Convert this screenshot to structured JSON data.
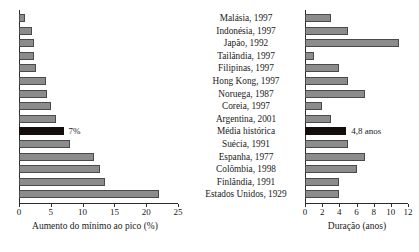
{
  "chart_data": [
    {
      "type": "bar",
      "orientation": "horizontal",
      "title": "",
      "xlabel": "Aumento do mínimo ao pico (%)",
      "ylabel": "",
      "xlim": [
        0,
        25
      ],
      "xticks": [
        0,
        5,
        10,
        15,
        20,
        25
      ],
      "grid": false,
      "legend": null,
      "categories": [
        "Malásia, 1997",
        "Indonésia, 1997",
        "Japão, 1992",
        "Tailândia, 1997",
        "Filipinas, 1997",
        "Hong Kong, 1997",
        "Noruega, 1987",
        "Coreia, 1997",
        "Argentina, 2001",
        "Média histórica",
        "Suécia, 1991",
        "Espanha, 1977",
        "Colômbia, 1998",
        "Finlândia, 1991",
        "Estados Unidos, 1929"
      ],
      "values": [
        1.0,
        2.0,
        2.4,
        2.4,
        2.7,
        4.3,
        4.4,
        5.0,
        5.8,
        7.0,
        8.0,
        11.8,
        12.8,
        13.5,
        22.0
      ],
      "annotations": [
        {
          "category": "Média histórica",
          "text": "7%"
        }
      ],
      "highlight_category": "Média histórica"
    },
    {
      "type": "bar",
      "orientation": "horizontal",
      "title": "",
      "xlabel": "Duração (anos)",
      "ylabel": "",
      "xlim": [
        0,
        12
      ],
      "xticks": [
        0,
        2,
        4,
        6,
        8,
        10,
        12
      ],
      "grid": false,
      "legend": null,
      "categories": [
        "Malásia, 1997",
        "Indonésia, 1997",
        "Japão, 1992",
        "Tailândia, 1997",
        "Filipinas, 1997",
        "Hong Kong, 1997",
        "Noruega, 1987",
        "Coreia, 1997",
        "Argentina, 2001",
        "Média histórica",
        "Suécia, 1991",
        "Espanha, 1977",
        "Colômbia, 1998",
        "Finlândia, 1991",
        "Estados Unidos, 1929"
      ],
      "values": [
        3.0,
        5.0,
        11.0,
        1.0,
        4.0,
        5.0,
        7.0,
        2.0,
        3.0,
        4.8,
        5.0,
        7.0,
        6.0,
        4.0,
        4.0
      ],
      "annotations": [
        {
          "category": "Média histórica",
          "text": "4,8 anos"
        }
      ],
      "highlight_category": "Média histórica"
    }
  ],
  "colors": {
    "bar_fill": "#8c8c8c",
    "bar_edge": "#4a4a4a",
    "highlight_fill": "#140d0b",
    "axis": "#2b2b2b",
    "background": "#ffffff",
    "text": "#1a1a1a"
  }
}
